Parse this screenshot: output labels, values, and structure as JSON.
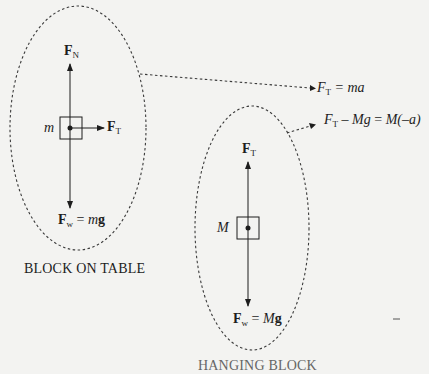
{
  "left_diagram": {
    "caption": "BLOCK ON TABLE",
    "mass_label": "m",
    "normal_force": {
      "symbol": "F",
      "subscript": "N"
    },
    "tension_force": {
      "symbol": "F",
      "subscript": "T"
    },
    "weight_force": {
      "symbol": "F",
      "subscript": "w",
      "equals": " = ",
      "mass": "m",
      "g": "g"
    }
  },
  "right_diagram": {
    "caption": "HANGING BLOCK",
    "mass_label": "M",
    "tension_force": {
      "symbol": "F",
      "subscript": "T"
    },
    "weight_force": {
      "symbol": "F",
      "subscript": "w",
      "equals": " = ",
      "mass": "M",
      "g": "g"
    }
  },
  "equations": {
    "eq1": {
      "F": "F",
      "sub": "T",
      "rest": " = ma"
    },
    "eq2": {
      "F": "F",
      "sub": "T",
      "middle": " – ",
      "Mg": "Mg",
      "eq": " = ",
      "rhs": "M(–a)"
    }
  },
  "colors": {
    "background": "#f3f3f1",
    "ink": "#1d1d1d",
    "dashed": "#3a3a3a"
  }
}
